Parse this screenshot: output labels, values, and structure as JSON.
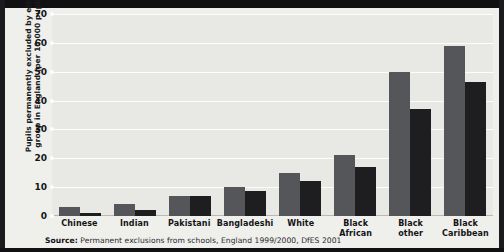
{
  "figure": {
    "ylabel_line1": "Pupils permanently excluded by ethnic",
    "ylabel_line2": "group in England (per 10,000 pupils)",
    "source_prefix": "Source:",
    "source_text": "Permanent exclusions from schools, England 1999/2000, DfES 2001",
    "colors": {
      "series_1997_98": "#55565a",
      "series_1999_00": "#1e1e20",
      "plot_background": "#e8e8e4",
      "figure_background": "#efefec",
      "gridline": "#fdfdfc",
      "page_background": "#111113"
    }
  },
  "chart_data": {
    "type": "bar",
    "title": "",
    "xlabel": "",
    "ylabel": "Pupils permanently excluded by ethnic group in England (per 10,000 pupils)",
    "ylim": [
      0,
      70
    ],
    "yticks": [
      0,
      10,
      20,
      30,
      40,
      50,
      60,
      70
    ],
    "grid": true,
    "legend_position": "top-left",
    "categories": [
      "Chinese",
      "Indian",
      "Pakistani",
      "Bangladeshi",
      "White",
      "Black African",
      "Black other",
      "Black Caribbean"
    ],
    "category_labels": [
      [
        "Chinese"
      ],
      [
        "Indian"
      ],
      [
        "Pakistani"
      ],
      [
        "Bangladeshi"
      ],
      [
        "White"
      ],
      [
        "Black",
        "African"
      ],
      [
        "Black",
        "other"
      ],
      [
        "Black",
        "Caribbean"
      ]
    ],
    "series": [
      {
        "name": "1997/98",
        "color": "#55565a",
        "values": [
          3,
          4,
          7,
          10,
          15,
          21,
          50,
          59
        ]
      },
      {
        "name": "1999/00",
        "color": "#1e1e20",
        "values": [
          1,
          2,
          7,
          8.5,
          12,
          17,
          37,
          46.5
        ]
      }
    ]
  }
}
